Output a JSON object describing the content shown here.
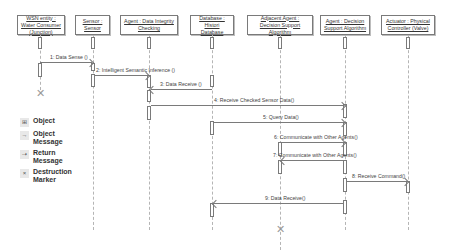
{
  "objects": [
    {
      "label": "WSN entity : Water Consumer (Junction)"
    },
    {
      "label": "Sensor : Sensor"
    },
    {
      "label": "Agent : Data Integrity Checking"
    },
    {
      "label": "Database : Histori Database"
    },
    {
      "label": "Adjacent Agent : Decision Support Algorithm"
    },
    {
      "label": "Agent : Decision Support Algorithm"
    },
    {
      "label": "Actuator : Physical Controller (Valve)"
    }
  ],
  "messages": [
    {
      "label": "1: Data Sense ()",
      "from": "WSN entity",
      "to": "Sensor"
    },
    {
      "label": "2: Intelligent Semantic Inference ()",
      "from": "Sensor",
      "to": "Agent : Data Integrity Checking"
    },
    {
      "label": "3: Data Receive ()",
      "from": "Database",
      "to": "Agent : Data Integrity Checking"
    },
    {
      "label": "4: Receive Checked Sensor Data()",
      "from": "Agent : Data Integrity Checking",
      "to": "Agent : Decision Support Algorithm"
    },
    {
      "label": "5: Query Data()",
      "from": "Database",
      "to": "Agent : Decision Support Algorithm"
    },
    {
      "label": "6: Communicate with Other Agents()",
      "from": "Adjacent Agent",
      "to": "Agent : Decision Support Algorithm"
    },
    {
      "label": "7: Communicate with Other Agents()",
      "from": "Agent : Decision Support Algorithm",
      "to": "Adjacent Agent"
    },
    {
      "label": "8: Receive Command()",
      "from": "Agent : Decision Support Algorithm",
      "to": "Actuator"
    },
    {
      "label": "9: Data Receive()",
      "from": "Agent : Decision Support Algorithm",
      "to": "Database"
    }
  ],
  "legend": [
    {
      "icon": "object-icon",
      "glyph": "⊞",
      "label": "Object"
    },
    {
      "icon": "object-message-icon",
      "glyph": "→",
      "label": "Object Message"
    },
    {
      "icon": "return-message-icon",
      "glyph": "⇢",
      "label": "Return Message"
    },
    {
      "icon": "destruction-marker-icon",
      "glyph": "×",
      "label": "Destruction Marker"
    }
  ],
  "destruction_marker": "✕"
}
